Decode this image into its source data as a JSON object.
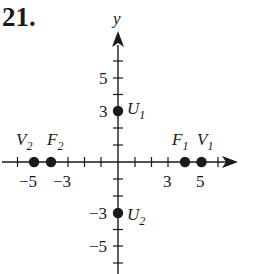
{
  "problem": {
    "number": "21."
  },
  "axes": {
    "y_label": "y",
    "x_tick_labels": [
      {
        "value": -5,
        "text": "−5"
      },
      {
        "value": -3,
        "text": "−3"
      },
      {
        "value": 3,
        "text": "3"
      },
      {
        "value": 5,
        "text": "5"
      }
    ],
    "y_tick_labels": [
      {
        "value": 5,
        "text": "5"
      },
      {
        "value": 3,
        "text": "3"
      },
      {
        "value": -3,
        "text": "−3"
      },
      {
        "value": -5,
        "text": "−5"
      }
    ],
    "x_range": [
      -6,
      6
    ],
    "y_range": [
      -6,
      6
    ]
  },
  "points": [
    {
      "name": "V",
      "sub": "2",
      "x": -5,
      "y": 0
    },
    {
      "name": "F",
      "sub": "2",
      "x": -4,
      "y": 0
    },
    {
      "name": "F",
      "sub": "1",
      "x": 4,
      "y": 0
    },
    {
      "name": "V",
      "sub": "1",
      "x": 5,
      "y": 0
    },
    {
      "name": "U",
      "sub": "1",
      "x": 0,
      "y": 3
    },
    {
      "name": "U",
      "sub": "2",
      "x": 0,
      "y": -3
    }
  ],
  "colors": {
    "ink": "#1a1a1a",
    "background": "#ffffff"
  }
}
